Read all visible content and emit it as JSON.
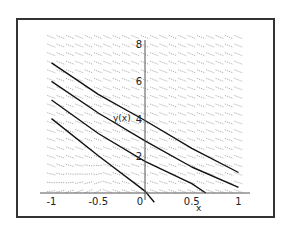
{
  "chart_data": {
    "type": "line",
    "title": "",
    "xlabel": "x",
    "ylabel": "y(x)",
    "xlim": [
      -1,
      1
    ],
    "ylim": [
      0,
      8.4
    ],
    "x_ticks": [
      "-1",
      "-0.5",
      "0",
      "0.5",
      "1"
    ],
    "x_tick_values": [
      -1,
      -0.5,
      0,
      0.5,
      1
    ],
    "y_ticks": [
      "2",
      "4",
      "6",
      "8"
    ],
    "y_tick_values": [
      2,
      4,
      6,
      8
    ],
    "grid": false,
    "legend": null,
    "direction_field": true,
    "series": [
      {
        "name": "solution-1",
        "x": [
          -1,
          -0.5,
          0,
          0.5,
          1
        ],
        "y": [
          7.0,
          5.3,
          3.9,
          2.4,
          1.1
        ]
      },
      {
        "name": "solution-2",
        "x": [
          -1,
          -0.5,
          0,
          0.5,
          1
        ],
        "y": [
          6.0,
          4.3,
          2.8,
          1.4,
          0.3
        ]
      },
      {
        "name": "solution-3",
        "x": [
          -1,
          -0.5,
          0,
          0.5,
          0.65
        ],
        "y": [
          5.0,
          3.2,
          1.7,
          0.5,
          0.0
        ]
      },
      {
        "name": "solution-4",
        "x": [
          -1,
          -0.5,
          0,
          0.1
        ],
        "y": [
          4.0,
          2.0,
          0.1,
          -0.5
        ]
      }
    ]
  },
  "axes": {
    "x_label": "x",
    "y_label": "y(x)",
    "x_tick_labels": [
      "-1",
      "-0.5",
      "0",
      "0.5",
      "1"
    ],
    "y_tick_labels": [
      "8",
      "6",
      "4",
      "2"
    ]
  }
}
